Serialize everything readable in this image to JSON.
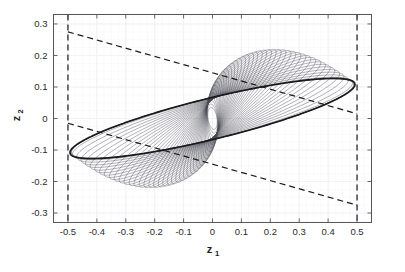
{
  "chart_data": {
    "type": "line",
    "title": "",
    "subtitle": "",
    "xlabel": "z",
    "xlabel_sub": "1",
    "ylabel": "z",
    "ylabel_sub": "2",
    "xlim": [
      -0.55,
      0.55
    ],
    "ylim": [
      -0.33,
      0.33
    ],
    "xticks": [
      -0.5,
      -0.4,
      -0.3,
      -0.2,
      -0.1,
      0,
      0.1,
      0.2,
      0.3,
      0.4,
      0.5
    ],
    "xticklabels": [
      "-0.5",
      "-0.4",
      "-0.3",
      "-0.2",
      "-0.1",
      "0",
      "0.1",
      "0.2",
      "0.3",
      "0.4",
      "0.5"
    ],
    "yticks": [
      0.3,
      0.2,
      0.1,
      0,
      -0.1,
      -0.2,
      -0.3
    ],
    "yticklabels": [
      "0.3",
      "0.2",
      "0.1",
      "0",
      "-0.1",
      "-0.2",
      "-0.3"
    ],
    "grid": true,
    "grid_color": "#e9e9ef",
    "box": true,
    "background": "#ffffff",
    "series": [
      {
        "name": "invariant-set-boundary",
        "type": "ellipse",
        "style": "solid",
        "color": "#1a1a1a",
        "linewidth": 1.6,
        "semi_major": 0.505,
        "semi_minor": 0.0655,
        "rotation_deg": 12.6,
        "center": [
          0,
          0
        ]
      },
      {
        "name": "constraint-line-upper",
        "type": "line",
        "style": "dashed",
        "color": "#1a1a1a",
        "linewidth": 1.2,
        "points": [
          [
            -0.5,
            0.275
          ],
          [
            0.5,
            0.015
          ]
        ]
      },
      {
        "name": "constraint-line-lower",
        "type": "line",
        "style": "dashed",
        "color": "#1a1a1a",
        "linewidth": 1.2,
        "points": [
          [
            -0.5,
            -0.015
          ],
          [
            0.5,
            -0.275
          ]
        ]
      },
      {
        "name": "state-constraint-left",
        "type": "vline",
        "style": "dashed",
        "color": "#1a1a1a",
        "linewidth": 1.2,
        "x": -0.5
      },
      {
        "name": "state-constraint-right",
        "type": "vline",
        "style": "dashed",
        "color": "#1a1a1a",
        "linewidth": 1.2,
        "x": 0.5
      },
      {
        "name": "closed-loop-trajectories",
        "type": "trajectory-family",
        "style": "solid",
        "color": "#4a4a55",
        "linewidth": 0.5,
        "count": 40,
        "description": "nested rotated ellipse trajectories pinched at origin forming a twisted double-lobe pattern",
        "scales": [
          0.985,
          0.962,
          0.938,
          0.915,
          0.891,
          0.868,
          0.844,
          0.821,
          0.797,
          0.774,
          0.75,
          0.727,
          0.703,
          0.68,
          0.656,
          0.633,
          0.609,
          0.586,
          0.562,
          0.539,
          0.515,
          0.492,
          0.468,
          0.445,
          0.421,
          0.398,
          0.374,
          0.351,
          0.327,
          0.304,
          0.28,
          0.257,
          0.233,
          0.21,
          0.186,
          0.163,
          0.139,
          0.116,
          0.092,
          0.069
        ],
        "twist_deg": 95
      }
    ]
  }
}
